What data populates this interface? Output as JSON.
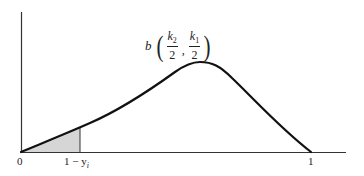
{
  "diagram": {
    "type": "beta density curve",
    "title": {
      "function": "b",
      "arg1": {
        "numerator_base": "k",
        "numerator_sub": "2",
        "denominator": "2"
      },
      "separator": ",",
      "arg2": {
        "numerator_base": "k",
        "numerator_sub": "1",
        "denominator": "2"
      }
    },
    "x_axis": {
      "labels": [
        {
          "text": "0",
          "x": 21
        },
        {
          "text": "1 − y",
          "sub": "i",
          "x": 80
        },
        {
          "text": "1",
          "x": 311
        }
      ]
    },
    "shaded_region": {
      "from": "0",
      "to": "1 − y_i",
      "color": "#d6d6d6"
    },
    "colors": {
      "curve": "#111111",
      "axis": "#333333",
      "shade": "#d6d6d6"
    }
  }
}
